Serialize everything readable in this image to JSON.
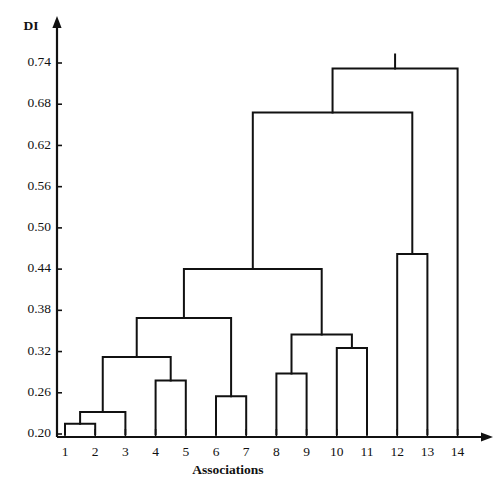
{
  "chart_data": {
    "type": "dendrogram",
    "title": "",
    "xlabel": "Associations",
    "ylabel": "DI",
    "ylim": [
      0.2,
      0.77
    ],
    "grid": false,
    "legend": null,
    "y_ticks": [
      0.2,
      0.26,
      0.32,
      0.38,
      0.44,
      0.5,
      0.56,
      0.62,
      0.68,
      0.74
    ],
    "y_tick_labels": [
      "0.20",
      "0.26",
      "0.32",
      "0.38",
      "0.44",
      "0.50",
      "0.56",
      "0.62",
      "0.68",
      "0.74"
    ],
    "leaves": [
      1,
      2,
      3,
      4,
      5,
      6,
      7,
      8,
      9,
      10,
      11,
      12,
      13,
      14
    ],
    "leaf_labels": [
      "1",
      "2",
      "3",
      "4",
      "5",
      "6",
      "7",
      "8",
      "9",
      "10",
      "11",
      "12",
      "13",
      "14"
    ],
    "baseline": 0.2,
    "merges": [
      {
        "id": "m1",
        "left": "leaf:1",
        "right": "leaf:2",
        "height": 0.215
      },
      {
        "id": "m2",
        "left": "m1",
        "right": "leaf:3",
        "height": 0.232
      },
      {
        "id": "m3",
        "left": "leaf:4",
        "right": "leaf:5",
        "height": 0.278
      },
      {
        "id": "m4",
        "left": "m2",
        "right": "m3",
        "height": 0.312
      },
      {
        "id": "m5",
        "left": "leaf:6",
        "right": "leaf:7",
        "height": 0.255
      },
      {
        "id": "m6",
        "left": "m4",
        "right": "m5",
        "height": 0.369
      },
      {
        "id": "m7",
        "left": "leaf:8",
        "right": "leaf:9",
        "height": 0.288
      },
      {
        "id": "m8",
        "left": "leaf:10",
        "right": "leaf:11",
        "height": 0.325
      },
      {
        "id": "m9",
        "left": "m7",
        "right": "m8",
        "height": 0.345
      },
      {
        "id": "m10",
        "left": "m6",
        "right": "m9",
        "height": 0.44
      },
      {
        "id": "m11",
        "left": "leaf:12",
        "right": "leaf:13",
        "height": 0.462
      },
      {
        "id": "m12",
        "left": "m10",
        "right": "m11",
        "height": 0.668
      },
      {
        "id": "m13",
        "left": "m12",
        "right": "leaf:14",
        "height": 0.732
      }
    ]
  },
  "axes": {
    "y_axis_title": "DI",
    "x_axis_title": "Associations"
  }
}
